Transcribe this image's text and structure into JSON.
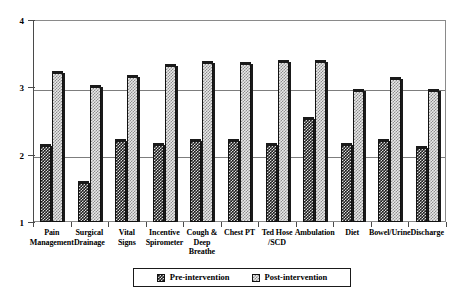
{
  "chart_data": {
    "type": "bar",
    "title": "",
    "subtitle": "",
    "xlabel": "",
    "ylabel": "",
    "ylim": [
      1,
      4
    ],
    "yticks": [
      1,
      2,
      3,
      4
    ],
    "ytick_labels": [
      "1",
      "2",
      "3",
      "4"
    ],
    "grid": true,
    "legend_position": "bottom",
    "categories": [
      "Pain Management",
      "Surgical Drainage",
      "Vital Signs",
      "Incentive Spirometer",
      "Cough & Deep Breathe",
      "Chest PT",
      "Ted Hose /SCD",
      "Ambulation",
      "Diet",
      "Bowel/Urine",
      "Discharge"
    ],
    "category_lines": [
      [
        "Pain",
        "Management"
      ],
      [
        "Surgical",
        "Drainage"
      ],
      [
        "Vital",
        "Signs"
      ],
      [
        "Incentive",
        "Spirometer"
      ],
      [
        "Cough &",
        "Deep",
        "Breathe"
      ],
      [
        "Chest PT"
      ],
      [
        "Ted Hose",
        "/SCD"
      ],
      [
        "Ambulation"
      ],
      [
        "Diet"
      ],
      [
        "Bowel/Urine"
      ],
      [
        "Discharge"
      ]
    ],
    "series": [
      {
        "name": "Pre-intervention",
        "values": [
          2.13,
          1.58,
          2.2,
          2.15,
          2.2,
          2.2,
          2.15,
          2.53,
          2.15,
          2.21,
          2.1
        ]
      },
      {
        "name": "Post-intervention",
        "values": [
          3.22,
          3.0,
          3.16,
          3.32,
          3.36,
          3.35,
          3.38,
          3.38,
          2.95,
          3.12,
          2.95
        ]
      }
    ]
  },
  "legend": {
    "items": [
      {
        "label": "Pre-intervention",
        "pattern": "dark-checker"
      },
      {
        "label": "Post-intervention",
        "pattern": "light-checker"
      }
    ]
  },
  "colors": {
    "pre_fill": "#1d1d1d",
    "post_fill": "#e8e8e8",
    "outline": "#111111",
    "grid": "#7d7d7d",
    "axis": "#4a4a4a",
    "background": "#ffffff"
  }
}
